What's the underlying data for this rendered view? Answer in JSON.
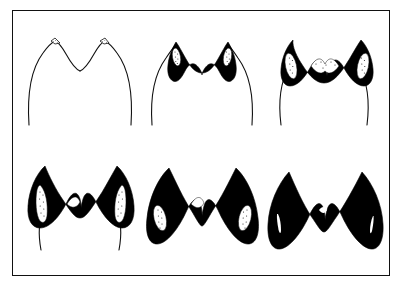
{
  "figure": {
    "type": "line-drawing-plate",
    "page_mark": "...",
    "frame": {
      "border_color": "#111111",
      "background_color": "#ffffff",
      "border_width_px": 1.6,
      "x": 12,
      "y": 10,
      "width": 378,
      "height": 266
    },
    "ink_color": "#000000",
    "outline_color": "#111111",
    "stipple_color": "#1a1a1a",
    "layout": {
      "rows": 2,
      "columns": 3,
      "order": "left-to-right, top-to-bottom"
    },
    "panels": [
      {
        "index": 1,
        "row": 1,
        "column": 1,
        "wear_stage": "unworn",
        "label": "",
        "enamel_band": "hairline outline only",
        "dentine_exposure": "none",
        "stipple_patches": 2,
        "stipple_size": "minute specks at cusp apices"
      },
      {
        "index": 2,
        "row": 1,
        "column": 2,
        "wear_stage": "slight wear",
        "label": "",
        "enamel_band": "thin black band along crest",
        "dentine_exposure": "two small stippled islands in cusps",
        "stipple_patches": 2,
        "stipple_size": "small"
      },
      {
        "index": 3,
        "row": 1,
        "column": 3,
        "wear_stage": "moderate wear",
        "label": "",
        "enamel_band": "broad black band, notch deepened",
        "dentine_exposure": "two elongate stippled islands plus central stippled strip",
        "stipple_patches": 3,
        "stipple_size": "medium"
      },
      {
        "index": 4,
        "row": 2,
        "column": 1,
        "wear_stage": "advanced wear",
        "label": "",
        "enamel_band": "very broad black band",
        "dentine_exposure": "two long stippled flanking areas",
        "stipple_patches": 2,
        "stipple_size": "large, elongate"
      },
      {
        "index": 5,
        "row": 2,
        "column": 2,
        "wear_stage": "heavy wear",
        "label": "",
        "enamel_band": "massive black band, flanks splayed outward",
        "dentine_exposure": "two oval stippled areas set low on the flanks",
        "stipple_patches": 2,
        "stipple_size": "oval"
      },
      {
        "index": 6,
        "row": 2,
        "column": 3,
        "wear_stage": "extreme wear",
        "label": "",
        "enamel_band": "solid black throughout",
        "dentine_exposure": "reduced to thin white slivers",
        "stipple_patches": 2,
        "stipple_size": "slivers only"
      }
    ]
  }
}
